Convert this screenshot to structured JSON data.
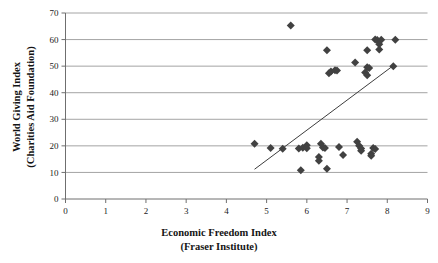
{
  "chart_data": {
    "type": "scatter",
    "title": "",
    "xlabel": "Economic Freedom Index",
    "xlabel_sub": "(Fraser Institute)",
    "ylabel": "World Giving Index",
    "ylabel_sub": "(Charities Aid Foundation)",
    "xlim": [
      0,
      9
    ],
    "ylim": [
      0,
      70
    ],
    "xticks": [
      "0",
      "1",
      "2",
      "3",
      "4",
      "5",
      "6",
      "7",
      "8",
      "9"
    ],
    "yticks": [
      "0",
      "10",
      "20",
      "30",
      "40",
      "50",
      "60",
      "70"
    ],
    "xtick_values": [
      0,
      1,
      2,
      3,
      4,
      5,
      6,
      7,
      8,
      9
    ],
    "ytick_values": [
      0,
      10,
      20,
      30,
      40,
      50,
      60,
      70
    ],
    "grid": "horizontal",
    "legend": "none",
    "marker_shape": "diamond",
    "marker_color": "#414141",
    "gridline_color": "#9a9a9a",
    "axis_color": "#6f6f6f",
    "trendline_color": "#3d3d3d",
    "series": [
      {
        "name": "Countries",
        "points": [
          [
            5.6,
            65.3
          ],
          [
            6.5,
            56.0
          ],
          [
            7.5,
            56.0
          ],
          [
            7.2,
            51.4
          ],
          [
            8.15,
            50.0
          ],
          [
            7.7,
            60.0
          ],
          [
            7.75,
            59.8
          ],
          [
            7.85,
            59.9
          ],
          [
            8.2,
            59.9
          ],
          [
            7.8,
            58.2
          ],
          [
            7.8,
            56.3
          ],
          [
            6.55,
            47.3
          ],
          [
            6.6,
            48.0
          ],
          [
            6.7,
            48.5
          ],
          [
            6.75,
            48.4
          ],
          [
            7.5,
            49.6
          ],
          [
            7.55,
            49.3
          ],
          [
            7.45,
            47.6
          ],
          [
            7.5,
            46.6
          ],
          [
            4.7,
            20.8
          ],
          [
            5.1,
            19.2
          ],
          [
            5.4,
            18.9
          ],
          [
            5.8,
            19.0
          ],
          [
            5.9,
            19.3
          ],
          [
            6.0,
            20.2
          ],
          [
            6.0,
            19.1
          ],
          [
            6.35,
            20.8
          ],
          [
            6.4,
            19.4
          ],
          [
            6.45,
            19.2
          ],
          [
            6.3,
            15.8
          ],
          [
            6.3,
            14.4
          ],
          [
            6.8,
            19.6
          ],
          [
            6.9,
            16.6
          ],
          [
            7.25,
            21.5
          ],
          [
            7.3,
            20.0
          ],
          [
            7.35,
            19.0
          ],
          [
            7.35,
            18.2
          ],
          [
            7.65,
            19.2
          ],
          [
            7.7,
            18.8
          ],
          [
            7.6,
            17.0
          ],
          [
            7.6,
            16.3
          ],
          [
            5.85,
            10.8
          ],
          [
            6.5,
            11.4
          ]
        ]
      }
    ],
    "trendline": {
      "x1": 4.7,
      "y1": 11.2,
      "x2": 8.15,
      "y2": 50.2
    }
  }
}
